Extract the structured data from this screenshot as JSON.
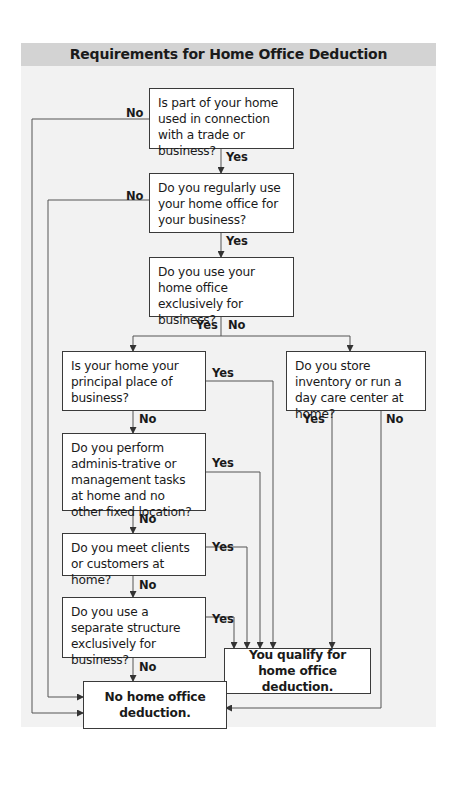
{
  "title": "Requirements for Home Office Deduction",
  "nodes": {
    "q1": "Is part of your home used in connection with a trade or business?",
    "q2": "Do you regularly use your home office for your business?",
    "q3": "Do you use your home office exclusively for business?",
    "q4": "Is your home your principal place of business?",
    "q5": "Do you store inventory or run a day care center at home?",
    "q6": "Do you perform adminis-trative or management tasks at home and no other fixed location?",
    "q7": "Do you meet clients or customers at home?",
    "q8": "Do you use a separate structure exclusively for business?",
    "qualify": "You qualify for home office deduction.",
    "no_deduction": "No home office deduction."
  },
  "labels": {
    "yes": "Yes",
    "no": "No"
  },
  "colors": {
    "header_bg": "#d3d3d3",
    "panel_bg": "#f2f2f2",
    "line": "#555555"
  }
}
